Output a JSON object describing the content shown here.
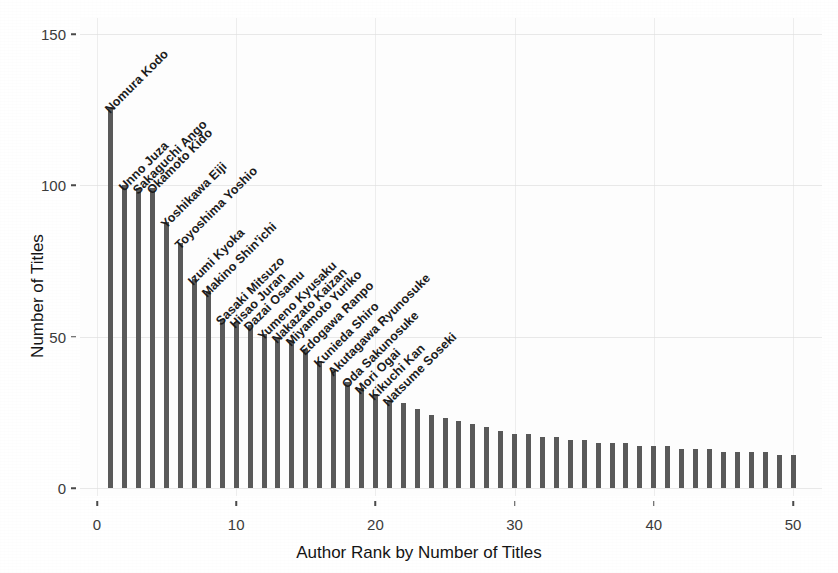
{
  "chart_data": {
    "type": "bar",
    "title": "",
    "xlabel": "Author Rank by Number of Titles",
    "ylabel": "Number of Titles",
    "xlim": [
      0,
      51
    ],
    "ylim": [
      0,
      158
    ],
    "xticks": [
      0,
      10,
      20,
      30,
      40,
      50
    ],
    "yticks": [
      0,
      50,
      100,
      150
    ],
    "grid": true,
    "legend": null,
    "bar_color": "#595959",
    "panel_background": "#fdfdfd",
    "x": [
      1,
      2,
      3,
      4,
      5,
      6,
      7,
      8,
      9,
      10,
      11,
      12,
      13,
      14,
      15,
      16,
      17,
      18,
      19,
      20,
      21,
      22,
      23,
      24,
      25,
      26,
      27,
      28,
      29,
      30,
      31,
      32,
      33,
      34,
      35,
      36,
      37,
      38,
      39,
      40,
      41,
      42,
      43,
      44,
      45,
      46,
      47,
      48,
      49,
      50
    ],
    "values": [
      126,
      100,
      99,
      99,
      88,
      81,
      69,
      65,
      56,
      55,
      54,
      51,
      50,
      49,
      46,
      42,
      39,
      35,
      33,
      31,
      29,
      28,
      26,
      24,
      23,
      22,
      21,
      20,
      19,
      18,
      18,
      17,
      17,
      16,
      16,
      15,
      15,
      15,
      14,
      14,
      14,
      13,
      13,
      13,
      12,
      12,
      12,
      12,
      11,
      11
    ],
    "point_labels": [
      "Nomura Kodo",
      "Unno Juza",
      "Sakaguchi Ango",
      "Okamoto Kido",
      "Yoshikawa Eiji",
      "Toyoshima Yoshio",
      "Izumi Kyoka",
      "Makino Shin'ichi",
      "Sasaki Mitsuzo",
      "Hisao Juran",
      "Dazai Osamu",
      "Yumeno Kyusaku",
      "Nakazato Kaizan",
      "Miyamoto Yuriko",
      "Edogawa Ranpo",
      "Kunieda Shiro",
      "Akutagawa Ryunosuke",
      "Oda Sakunosuke",
      "Mori Ogai",
      "Kikuchi Kan",
      "Natsume Soseki"
    ]
  }
}
